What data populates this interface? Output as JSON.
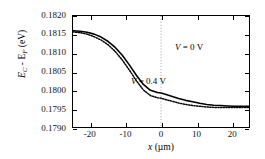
{
  "chart_data": {
    "type": "line",
    "title": "",
    "xlabel": "x (µm)",
    "ylabel": "E_C - E_F (eV)",
    "xlim": [
      -25,
      25
    ],
    "ylim": [
      0.179,
      0.182
    ],
    "xticks": [
      -20,
      -10,
      0,
      10,
      20
    ],
    "xtick_labels": [
      "-20",
      "-10",
      "0",
      "10",
      "20"
    ],
    "yticks": [
      0.179,
      0.1795,
      0.18,
      0.1805,
      0.181,
      0.1815,
      0.182
    ],
    "ytick_labels": [
      "0.1790",
      "0.1795",
      "0.1800",
      "0.1805",
      "0.1810",
      "0.1815",
      "0.1820"
    ],
    "grid": false,
    "vertical_marker_x": 0,
    "legend_position": "in-plot-annotations",
    "series": [
      {
        "name": "V = 0 V",
        "style": "solid",
        "color": "#000000",
        "x": [
          -25,
          -23,
          -21,
          -19,
          -17,
          -15,
          -13,
          -11,
          -9,
          -7,
          -5,
          -3,
          -1,
          0,
          1,
          3,
          5,
          7,
          9,
          11,
          13,
          15,
          17,
          19,
          21,
          23,
          25
        ],
        "y": [
          0.1816,
          0.18159,
          0.18156,
          0.18151,
          0.18143,
          0.18131,
          0.18115,
          0.18094,
          0.18068,
          0.1804,
          0.18015,
          0.17999,
          0.17993,
          0.17992,
          0.17989,
          0.17983,
          0.17977,
          0.17972,
          0.17968,
          0.17964,
          0.17961,
          0.17959,
          0.17958,
          0.17957,
          0.17956,
          0.17956,
          0.17956
        ]
      },
      {
        "name": "V = 0.4 V",
        "style": "dotted",
        "color": "#000000",
        "x": [
          -25,
          -23,
          -21,
          -19,
          -17,
          -15,
          -13,
          -11,
          -9,
          -7,
          -5,
          -3,
          -1,
          0,
          1,
          3,
          5,
          7,
          9,
          11,
          13,
          15,
          17,
          19,
          21,
          23,
          25
        ],
        "y": [
          0.18157,
          0.18155,
          0.18151,
          0.18144,
          0.18135,
          0.18122,
          0.18104,
          0.18081,
          0.18054,
          0.18025,
          0.18,
          0.17985,
          0.17979,
          0.17978,
          0.17975,
          0.1797,
          0.17965,
          0.17961,
          0.17958,
          0.17956,
          0.17954,
          0.17953,
          0.17953,
          0.17953,
          0.17953,
          0.17953,
          0.17953
        ]
      }
    ],
    "annotations": [
      {
        "text": "V = 0 V",
        "x": -11,
        "y": 0.1815
      },
      {
        "text": "V = 0.4 V",
        "x": -21,
        "y": 0.1806
      }
    ]
  },
  "axis": {
    "y_label_lead": "E",
    "y_label_sub1": "C",
    "y_label_mid": " - E",
    "y_label_sub2": "F",
    "y_label_tail": " (eV)",
    "x_label_lead": "x",
    "x_label_tail": " (µm)"
  },
  "annotations": {
    "v0": "V = 0 V",
    "v04": "V = 0.4 V",
    "v0_lead": "V",
    "v0_tail": " = 0 V",
    "v04_lead": "V",
    "v04_tail": " = 0.4 V"
  },
  "colors": {
    "axis": "#000000",
    "curve": "#000000",
    "marker_line": "#888888",
    "background": "#ffffff"
  }
}
